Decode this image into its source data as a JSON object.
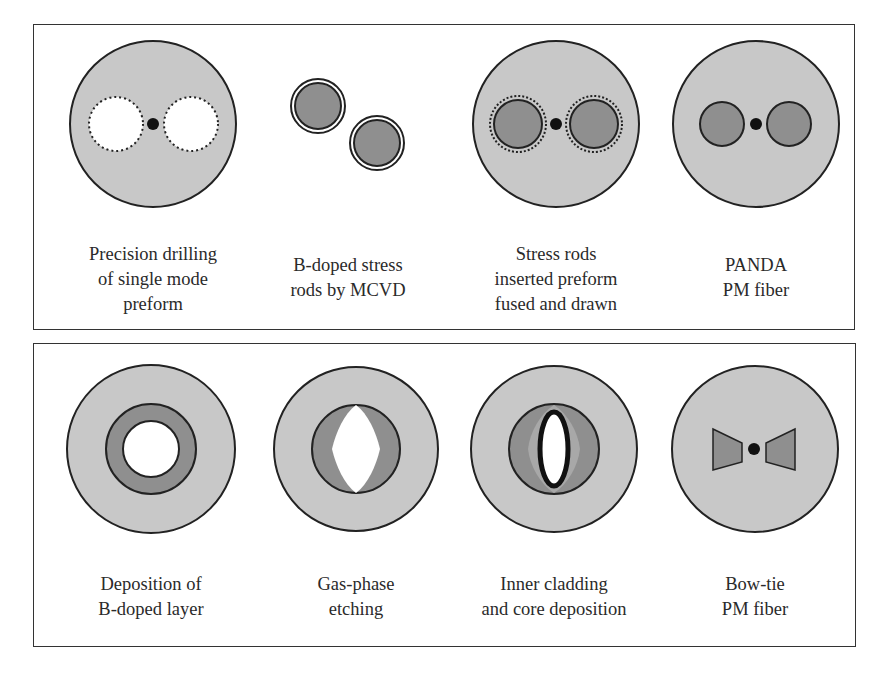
{
  "colors": {
    "cladding": "#c8c8c8",
    "stress_region": "#8f8f8f",
    "inner_cladding": "#a5a5a5",
    "core": "#111111",
    "outline": "#222222",
    "hole": "#ffffff"
  },
  "panels": [
    {
      "name": "PANDA fabrication",
      "steps": [
        {
          "id": "drilling",
          "caption_lines": [
            "Precision drilling",
            "of single mode",
            "preform"
          ],
          "icon": "drilled-preform-icon"
        },
        {
          "id": "stress-rods",
          "caption_lines": [
            "B-doped stress",
            "rods by MCVD"
          ],
          "icon": "stress-rods-icon"
        },
        {
          "id": "inserted",
          "caption_lines": [
            "Stress rods",
            "inserted preform",
            "fused and drawn"
          ],
          "icon": "inserted-preform-icon"
        },
        {
          "id": "panda",
          "caption_lines": [
            "PANDA",
            "PM fiber"
          ],
          "icon": "panda-fiber-icon"
        }
      ]
    },
    {
      "name": "Bow-tie fabrication",
      "steps": [
        {
          "id": "deposition",
          "caption_lines": [
            "Deposition of",
            "B-doped layer"
          ],
          "icon": "b-doped-layer-icon"
        },
        {
          "id": "etching",
          "caption_lines": [
            "Gas-phase",
            "etching"
          ],
          "icon": "gas-phase-etching-icon"
        },
        {
          "id": "inner-cladding",
          "caption_lines": [
            "Inner cladding",
            "and core deposition"
          ],
          "icon": "inner-cladding-icon"
        },
        {
          "id": "bowtie",
          "caption_lines": [
            "Bow-tie",
            "PM fiber"
          ],
          "icon": "bowtie-fiber-icon"
        }
      ]
    }
  ]
}
